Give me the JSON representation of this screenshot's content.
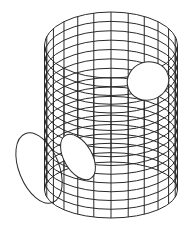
{
  "diagram": {
    "title": "",
    "type": "wireframe-cylinder",
    "background": "#ffffff",
    "stroke_color": "#2a2a2a",
    "stroke_width": 1,
    "cylinder": {
      "center_x": 111,
      "radius_x": 66.5,
      "top_center_y": 45,
      "top_radius_y": 33,
      "bottom_center_y": 190,
      "bottom_radius_y": 28,
      "rings": 17,
      "meridians": 24
    },
    "openings": [
      {
        "name": "right-hole",
        "cx": 148,
        "cy": 81,
        "rx": 21,
        "ry": 19,
        "rotate": -20
      },
      {
        "name": "left-hole-inner",
        "cx": 78,
        "cy": 157,
        "rx": 14,
        "ry": 25,
        "rotate": -30
      }
    ],
    "outer_ellipse": {
      "name": "left-ring",
      "cx": 39,
      "cy": 168,
      "rx": 20,
      "ry": 37,
      "rotate": -22
    }
  }
}
